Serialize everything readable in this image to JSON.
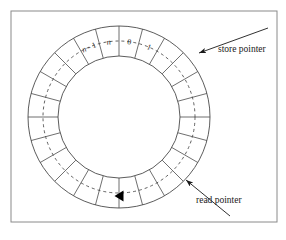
{
  "figure": {
    "kind": "circular-buffer-diagram",
    "frame": {
      "x": 11,
      "y": 11,
      "width": 266,
      "height": 211,
      "stroke": "#8a8a8a"
    },
    "ring": {
      "center_x": 119,
      "center_y": 117,
      "outer_radius": 91,
      "inner_radius": 61,
      "mid_dash_radius": 76,
      "segment_count": 24,
      "stroke": "#4a4a4a",
      "fill": "#ffffff"
    },
    "cells": [
      {
        "id": "cell-n-minus-1",
        "label": "n - 1",
        "italic_token": "n",
        "angle_deg": -112.5
      },
      {
        "id": "cell-n",
        "label": "n",
        "italic_token": "n",
        "angle_deg": -97.5
      },
      {
        "id": "cell-0",
        "label": "0",
        "italic_token": "",
        "angle_deg": -82.5
      },
      {
        "id": "cell-1",
        "label": "1",
        "italic_token": "",
        "angle_deg": -67.5
      }
    ],
    "read_pointer_marker": {
      "name": "read-pointer-arrowhead",
      "shape": "filled-triangle",
      "direction": "left",
      "x": 119,
      "y": 196,
      "color": "#000000"
    },
    "annotations": [
      {
        "id": "store-pointer",
        "label": "store pointer",
        "text_x": 218,
        "text_y": 52,
        "arrow_from_x": 268,
        "arrow_from_y": 28,
        "arrow_to_x": 199,
        "arrow_to_y": 53
      },
      {
        "id": "read-pointer",
        "label": "read pointer",
        "text_x": 196,
        "text_y": 203,
        "arrow_from_x": 230,
        "arrow_from_y": 216,
        "arrow_to_x": 186,
        "arrow_to_y": 180
      }
    ],
    "colors": {
      "frame_stroke": "#8a8a8a",
      "ring_stroke": "#4a4a4a",
      "dash_stroke": "#3a3a3a",
      "text": "#1a1a1a",
      "marker_fill": "#000000",
      "background": "#ffffff"
    }
  }
}
